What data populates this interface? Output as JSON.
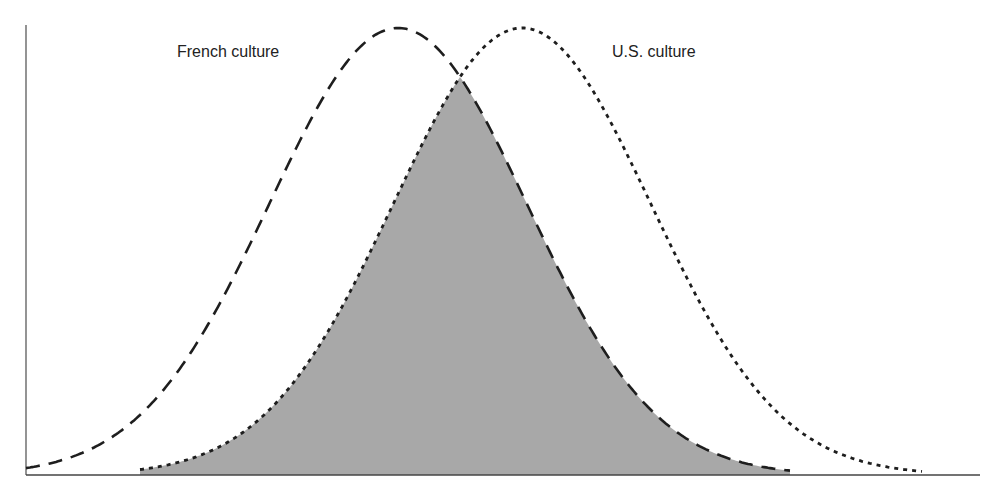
{
  "figure": {
    "labels": {
      "french": "French culture",
      "us": "U.S. culture"
    },
    "colors": {
      "overlap_fill": "#a8a8a8",
      "stroke": "#1e1e1e",
      "axis": "#555555",
      "background": "#ffffff"
    }
  },
  "chart_data": {
    "type": "area",
    "title": "",
    "xlabel": "",
    "ylabel": "",
    "grid": false,
    "legend": "inline labels near curve peaks",
    "axes": {
      "x_axis": true,
      "y_axis": true,
      "ticks": false
    },
    "series": [
      {
        "name": "French culture",
        "shape": "normal",
        "line_style": "dashed",
        "peak_x_rel": 0.39,
        "sigma_rel": 0.135,
        "peak_height_rel": 1.0
      },
      {
        "name": "U.S. culture",
        "shape": "normal",
        "line_style": "dotted",
        "peak_x_rel": 0.52,
        "sigma_rel": 0.135,
        "peak_height_rel": 1.0
      }
    ],
    "annotations": [
      {
        "type": "shaded-region",
        "description": "Overlap of the two distributions (shared norms)",
        "fill": "#a8a8a8"
      }
    ]
  }
}
